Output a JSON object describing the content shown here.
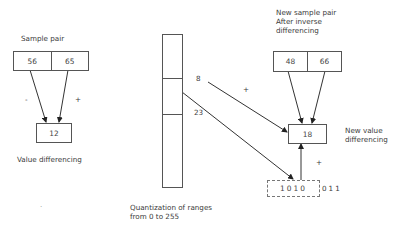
{
  "left": {
    "title": "Sample pair",
    "values": [
      "56",
      "65"
    ],
    "signs": [
      "-",
      "+"
    ],
    "difference": "12",
    "caption": "Value differencing"
  },
  "middle": {
    "bar_labels": [
      "8",
      "23"
    ],
    "plus": "+",
    "caption_line1": "Quantization of ranges",
    "caption_line2": "from 0 to 255"
  },
  "right": {
    "title_line1": "New sample pair",
    "title_line2": "After inverse",
    "title_line3": "differencing",
    "values": [
      "48",
      "66"
    ],
    "new_difference": "18",
    "caption_line1": "New value",
    "caption_line2": "differencing",
    "plus": "+",
    "secret_bits_embedded": "1010",
    "secret_bits_remaining": "011"
  },
  "stray_mark": "."
}
